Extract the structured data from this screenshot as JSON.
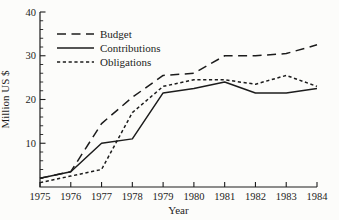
{
  "figure": {
    "background": "#fcfcfa",
    "line_color": "#1c1c1c"
  },
  "chart_data": {
    "type": "line",
    "title": "",
    "xlabel": "Year",
    "ylabel": "Million US $",
    "x": [
      1975,
      1976,
      1977,
      1978,
      1979,
      1980,
      1981,
      1982,
      1983,
      1984
    ],
    "xlim": [
      1975,
      1984
    ],
    "ylim": [
      0,
      40
    ],
    "yticks": [
      10,
      20,
      30,
      40
    ],
    "y_minor_step": 2,
    "grid": false,
    "legend_position": "upper-left",
    "series": [
      {
        "name": "Budget",
        "style": "long-dash",
        "values": [
          2,
          3.5,
          14.5,
          20.5,
          25.5,
          26,
          30,
          30,
          30.5,
          32.5
        ]
      },
      {
        "name": "Contributions",
        "style": "solid",
        "values": [
          2,
          3.5,
          10,
          11,
          21.5,
          22.5,
          24,
          21.5,
          21.5,
          22.5
        ]
      },
      {
        "name": "Obligations",
        "style": "short-dash",
        "values": [
          1,
          2.5,
          4,
          17,
          23,
          24.5,
          24.5,
          23.5,
          25.5,
          23
        ]
      }
    ]
  }
}
